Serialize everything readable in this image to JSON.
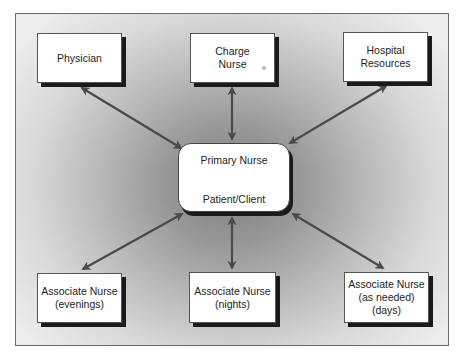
{
  "diagram": {
    "type": "hub-and-spoke communication diagram",
    "center": {
      "top_label": "Primary Nurse",
      "bottom_label": "Patient/Client",
      "internal_link": "bidirectional"
    },
    "nodes": [
      {
        "id": "physician",
        "lines": [
          "Physician"
        ]
      },
      {
        "id": "charge-nurse",
        "lines": [
          "Charge",
          "Nurse"
        ]
      },
      {
        "id": "hospital-resources",
        "lines": [
          "Hospital",
          "Resources"
        ]
      },
      {
        "id": "associate-nurse-evenings",
        "lines": [
          "Associate Nurse",
          "(evenings)"
        ]
      },
      {
        "id": "associate-nurse-nights",
        "lines": [
          "Associate Nurse",
          "(nights)"
        ]
      },
      {
        "id": "associate-nurse-as-needed",
        "lines": [
          "Associate Nurse",
          "(as needed)",
          "(days)"
        ]
      }
    ],
    "edges": [
      {
        "from": "center",
        "to": "physician",
        "direction": "bidirectional"
      },
      {
        "from": "center",
        "to": "charge-nurse",
        "direction": "bidirectional"
      },
      {
        "from": "center",
        "to": "hospital-resources",
        "direction": "bidirectional"
      },
      {
        "from": "center",
        "to": "associate-nurse-evenings",
        "direction": "bidirectional"
      },
      {
        "from": "center",
        "to": "associate-nurse-nights",
        "direction": "bidirectional"
      },
      {
        "from": "center",
        "to": "associate-nurse-as-needed",
        "direction": "bidirectional"
      }
    ],
    "colors": {
      "arrow": "#4a4a4a",
      "node_fill": "#ffffff",
      "shadow": "#1a1a1a",
      "background_center": "#7e7e7e",
      "background_edge": "#ececec"
    }
  }
}
